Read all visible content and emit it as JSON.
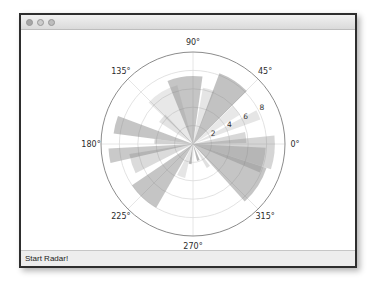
{
  "window": {
    "titlebar": {
      "title": "",
      "buttons": [
        {
          "name": "close"
        },
        {
          "name": "minimize"
        },
        {
          "name": "zoom"
        }
      ]
    },
    "statusbar": {
      "label": "Start Radar!"
    }
  },
  "colors": {
    "bar": "#7f7f7f",
    "grid": "#dadada",
    "outer_ring": "#8c8c8c",
    "label_text": "#2b2b2b",
    "statusbar_bg": "#ededed",
    "titlebar_bg": "#e6e6e6"
  },
  "chart_data": {
    "type": "polar_bar",
    "title": "",
    "angle_labels": [
      "0°",
      "45°",
      "90°",
      "135°",
      "180°",
      "225°",
      "270°",
      "315°"
    ],
    "radial_ticks": [
      2,
      4,
      6,
      8
    ],
    "r_max": 10,
    "grid": true,
    "legend": false,
    "bar_color": "#7f7f7f",
    "bars": [
      {
        "angle_deg": 7,
        "width_deg": 12,
        "radius": 5.8,
        "opacity": 0.3
      },
      {
        "angle_deg": -6,
        "width_deg": 24,
        "radius": 8.9,
        "opacity": 0.33
      },
      {
        "angle_deg": 24,
        "width_deg": 8,
        "radius": 7.8,
        "opacity": 0.2
      },
      {
        "angle_deg": 38,
        "width_deg": 12,
        "radius": 6.0,
        "opacity": 0.18
      },
      {
        "angle_deg": 57,
        "width_deg": 25,
        "radius": 8.2,
        "opacity": 0.48
      },
      {
        "angle_deg": 74,
        "width_deg": 12,
        "radius": 6.2,
        "opacity": 0.2
      },
      {
        "angle_deg": 97,
        "width_deg": 30,
        "radius": 7.4,
        "opacity": 0.45
      },
      {
        "angle_deg": 121,
        "width_deg": 32,
        "radius": 6.6,
        "opacity": 0.18
      },
      {
        "angle_deg": 140,
        "width_deg": 14,
        "radius": 4.4,
        "opacity": 0.22
      },
      {
        "angle_deg": 166,
        "width_deg": 13,
        "radius": 8.7,
        "opacity": 0.45
      },
      {
        "angle_deg": 176,
        "width_deg": 7,
        "radius": 4.2,
        "opacity": 0.35
      },
      {
        "angle_deg": 188,
        "width_deg": 10,
        "radius": 9.2,
        "opacity": 0.42
      },
      {
        "angle_deg": 198,
        "width_deg": 18,
        "radius": 7.0,
        "opacity": 0.28
      },
      {
        "angle_deg": 227,
        "width_deg": 26,
        "radius": 8.0,
        "opacity": 0.45
      },
      {
        "angle_deg": 250,
        "width_deg": 14,
        "radius": 3.8,
        "opacity": 0.2
      },
      {
        "angle_deg": 262,
        "width_deg": 8,
        "radius": 2.2,
        "opacity": 0.55
      },
      {
        "angle_deg": 288,
        "width_deg": 9,
        "radius": 1.9,
        "opacity": 0.55
      },
      {
        "angle_deg": 304,
        "width_deg": 8,
        "radius": 3.0,
        "opacity": 0.24
      },
      {
        "angle_deg": 327,
        "width_deg": 30,
        "radius": 8.4,
        "opacity": 0.45
      },
      {
        "angle_deg": 347,
        "width_deg": 20,
        "radius": 7.9,
        "opacity": 0.36
      }
    ]
  }
}
